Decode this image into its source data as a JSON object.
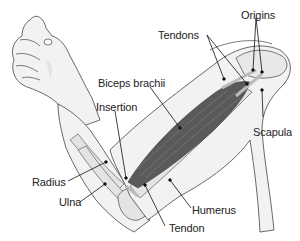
{
  "diagram": {
    "colors": {
      "skin_fill": "#f2f2f2",
      "skin_shadow": "#d8d8d8",
      "outline": "#444444",
      "bone_fill": "#e4e4e4",
      "muscle_fill": "#5a5a5a",
      "muscle_light": "#8a8a8a",
      "leader_line": "#111111",
      "label_text": "#222222"
    },
    "labels": {
      "tendons": "Tendons",
      "origins": "Origins",
      "biceps_brachii": "Biceps brachii",
      "insertion": "Insertion",
      "scapula": "Scapula",
      "radius": "Radius",
      "ulna": "Ulna",
      "humerus": "Humerus",
      "tendon": "Tendon"
    }
  }
}
